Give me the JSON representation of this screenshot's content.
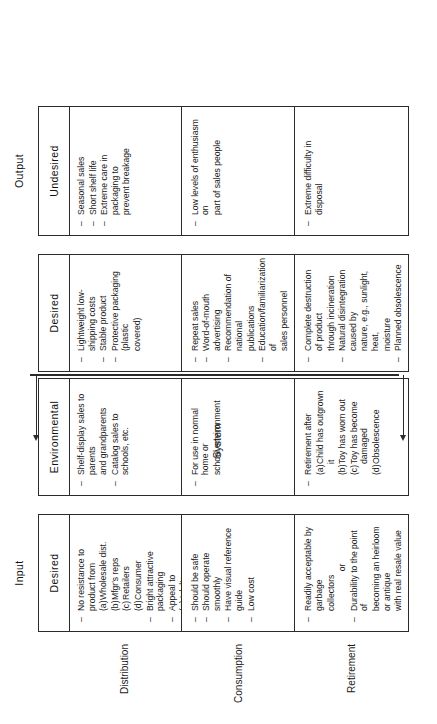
{
  "figure": {
    "orientation": "rotated-90-ccw",
    "system_label": "System"
  },
  "columns": [
    {
      "id": "input",
      "group": "Input",
      "sub": "Desired"
    },
    {
      "id": "environmental",
      "group": "",
      "sub": "Environmental"
    },
    {
      "id": "system_desired",
      "group": "",
      "sub": "Desired"
    },
    {
      "id": "output",
      "group": "Output",
      "sub": "Undesired"
    }
  ],
  "rows": [
    {
      "id": "distribution",
      "label": "Distribution"
    },
    {
      "id": "consumption",
      "label": "Consumption"
    },
    {
      "id": "retirement",
      "label": "Retirement"
    }
  ],
  "cells": {
    "input": {
      "distribution": [
        {
          "kind": "dash",
          "text": "No resistance to product from"
        },
        {
          "kind": "sub",
          "marker": "(a)",
          "text": "Wholesale dist."
        },
        {
          "kind": "sub",
          "marker": "(b)",
          "text": "Mfgr's reps"
        },
        {
          "kind": "sub",
          "marker": "(c)",
          "text": "Retailers"
        },
        {
          "kind": "sub",
          "marker": "(d)",
          "text": "Consumer"
        },
        {
          "kind": "dash",
          "text": "Bright attractive packaging"
        },
        {
          "kind": "dash",
          "text": "Appeal to"
        },
        {
          "kind": "sub",
          "marker": "(a)",
          "text": "Adults"
        },
        {
          "kind": "sub",
          "marker": "(b)",
          "text": "Children"
        }
      ],
      "consumption": [
        {
          "kind": "dash",
          "text": "Should be safe"
        },
        {
          "kind": "dash",
          "text": "Should operate smoothly"
        },
        {
          "kind": "dash",
          "text": "Have visual reference guide"
        },
        {
          "kind": "dash",
          "text": "Low cost"
        }
      ],
      "retirement": [
        {
          "kind": "dash",
          "text": "Readily acceptable by garbage"
        },
        {
          "kind": "cont",
          "text": "collectors"
        },
        {
          "kind": "or",
          "text": "or"
        },
        {
          "kind": "dash",
          "text": "Durability to the point of"
        },
        {
          "kind": "cont",
          "text": "becoming an heirloom or antique"
        },
        {
          "kind": "cont",
          "text": "with real resale value"
        }
      ]
    },
    "environmental": {
      "distribution": [
        {
          "kind": "dash",
          "text": "Shelf-display sales to parents"
        },
        {
          "kind": "cont",
          "text": "and grandparents"
        },
        {
          "kind": "dash",
          "text": "Catalog sales to schools, etc."
        }
      ],
      "consumption": [
        {
          "kind": "dash",
          "text": "For use in normal home or"
        },
        {
          "kind": "cont",
          "text": "school environment"
        }
      ],
      "retirement": [
        {
          "kind": "dash",
          "text": "Retirement after"
        },
        {
          "kind": "sub",
          "marker": "(a)",
          "text": "Child has outgrown it"
        },
        {
          "kind": "sub",
          "marker": "(b)",
          "text": "Toy has worn out"
        },
        {
          "kind": "sub",
          "marker": "(c)",
          "text": "Toy has become damaged"
        },
        {
          "kind": "sub",
          "marker": "(d)",
          "text": "Obsolescence"
        }
      ]
    },
    "system_desired": {
      "distribution": [
        {
          "kind": "dash",
          "text": "Lightweight low-shipping costs"
        },
        {
          "kind": "dash",
          "text": "Stable product"
        },
        {
          "kind": "dash",
          "text": "Protective packaging (plastic"
        },
        {
          "kind": "cont",
          "text": "covered)"
        }
      ],
      "consumption": [
        {
          "kind": "dash",
          "text": "Repeat sales"
        },
        {
          "kind": "dash",
          "text": "Word-of-mouth advertising"
        },
        {
          "kind": "dash",
          "text": "Recommendation of national"
        },
        {
          "kind": "cont",
          "text": "publications"
        },
        {
          "kind": "dash",
          "text": "Education/familiarization of"
        },
        {
          "kind": "cont",
          "text": "sales personnel"
        }
      ],
      "retirement": [
        {
          "kind": "dash",
          "text": "Complete destruction of product"
        },
        {
          "kind": "cont",
          "text": "through incineration"
        },
        {
          "kind": "dash",
          "text": "Natural disintegration caused by"
        },
        {
          "kind": "cont",
          "text": "nature, e.g., sunlight, heat,"
        },
        {
          "kind": "cont",
          "text": "moisture"
        },
        {
          "kind": "dash",
          "text": "Planned obsolescence"
        }
      ]
    },
    "output": {
      "distribution": [
        {
          "kind": "dash",
          "text": "Seasonal sales"
        },
        {
          "kind": "dash",
          "text": "Short shelf life"
        },
        {
          "kind": "dash",
          "text": "Extreme care in packaging to"
        },
        {
          "kind": "cont",
          "text": "prevent breakage"
        }
      ],
      "consumption": [
        {
          "kind": "dash",
          "text": "Low levels of enthusiasm on"
        },
        {
          "kind": "cont",
          "text": "part of sales people"
        }
      ],
      "retirement": [
        {
          "kind": "dash",
          "text": "Extreme difficulty in disposal"
        }
      ]
    }
  }
}
